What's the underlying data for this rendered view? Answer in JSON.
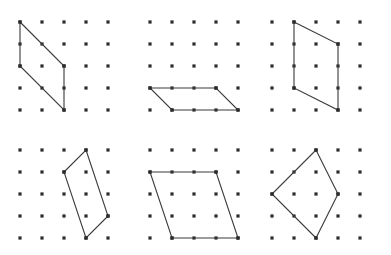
{
  "figure": {
    "background_color": "#ffffff",
    "dot_color": "#2b2b2b",
    "outline_color": "#3a3a3a",
    "dot_size": 3.2,
    "stroke_width": 1.1,
    "grid": {
      "columns": 5,
      "rows": 5,
      "spacing": 22
    },
    "panels": [
      {
        "name": "panel-1",
        "label": "",
        "origin": [
          20,
          22
        ],
        "shape": "parallelogram",
        "vertices": [
          [
            0,
            0
          ],
          [
            2,
            2
          ],
          [
            2,
            4
          ],
          [
            0,
            2
          ]
        ]
      },
      {
        "name": "panel-2",
        "label": "",
        "origin": [
          150,
          22
        ],
        "shape": "parallelogram",
        "vertices": [
          [
            0,
            3
          ],
          [
            3,
            3
          ],
          [
            4,
            4
          ],
          [
            1,
            4
          ]
        ]
      },
      {
        "name": "panel-3",
        "label": "",
        "origin": [
          272,
          22
        ],
        "shape": "parallelogram",
        "vertices": [
          [
            1,
            0
          ],
          [
            3,
            1
          ],
          [
            3,
            4
          ],
          [
            1,
            3
          ]
        ]
      },
      {
        "name": "panel-4",
        "label": "",
        "origin": [
          20,
          150
        ],
        "shape": "parallelogram",
        "vertices": [
          [
            3,
            0
          ],
          [
            4,
            3
          ],
          [
            3,
            4
          ],
          [
            2,
            1
          ]
        ]
      },
      {
        "name": "panel-5",
        "label": "",
        "origin": [
          150,
          150
        ],
        "shape": "parallelogram",
        "vertices": [
          [
            0,
            1
          ],
          [
            3,
            1
          ],
          [
            4,
            4
          ],
          [
            1,
            4
          ]
        ]
      },
      {
        "name": "panel-6",
        "label": "",
        "origin": [
          272,
          150
        ],
        "shape": "parallelogram",
        "vertices": [
          [
            2,
            0
          ],
          [
            3,
            2
          ],
          [
            2,
            4
          ],
          [
            0,
            2
          ]
        ]
      }
    ]
  }
}
